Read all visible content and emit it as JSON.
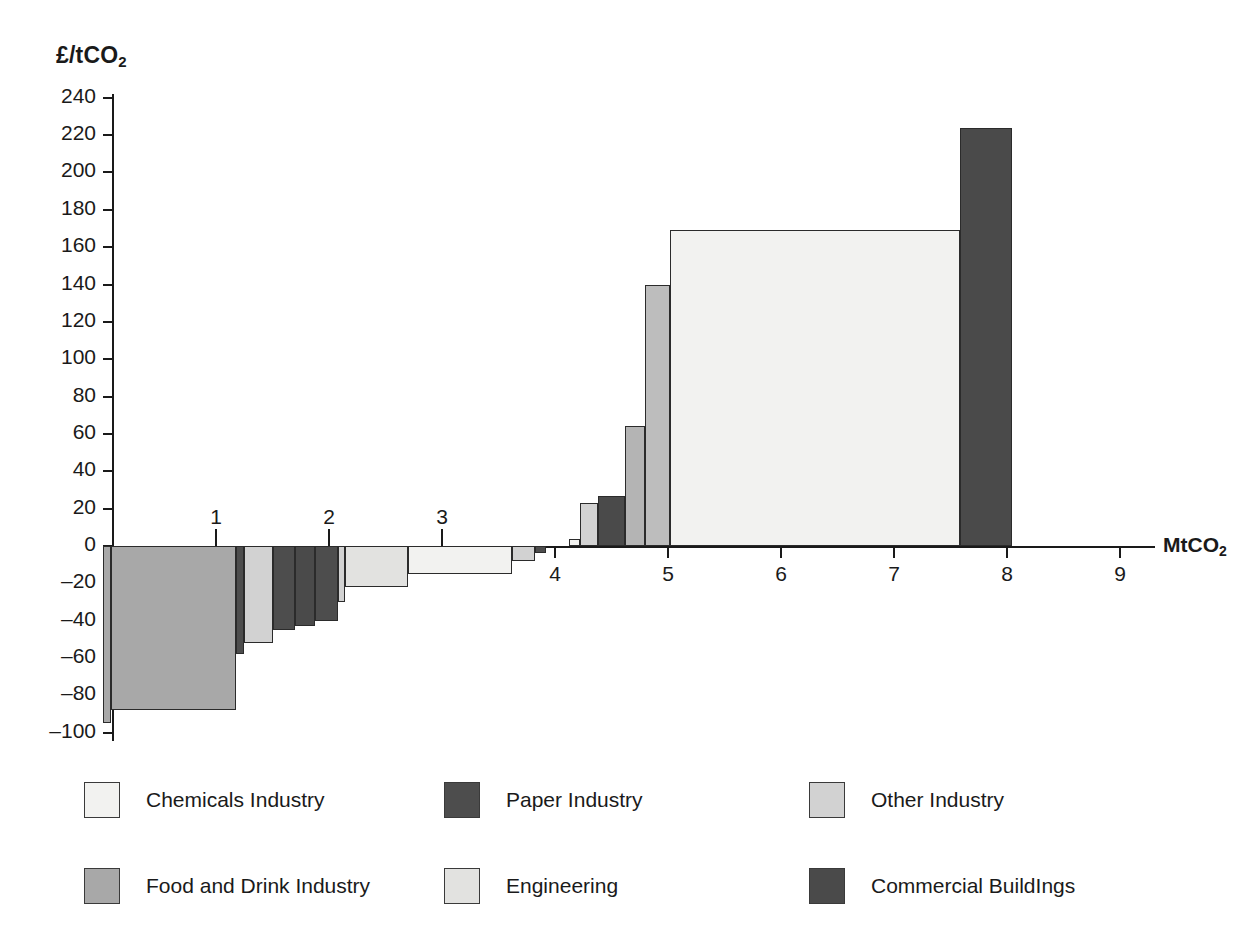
{
  "chart_data": {
    "type": "bar",
    "title": "",
    "subtitle": "",
    "xlabel": "MtCO2",
    "ylabel": "£/tCO2",
    "ylabel_rich": "£/tCO",
    "ylabel_sub": "2",
    "xlabel_rich": "MtCO",
    "xlabel_sub": "2",
    "xlim": [
      0,
      9
    ],
    "ylim": [
      -100,
      240
    ],
    "grid": false,
    "legend_position": "bottom",
    "orientation": "marginal-abatement-cost-curve",
    "y_ticks": [
      240,
      220,
      200,
      180,
      160,
      140,
      120,
      100,
      80,
      60,
      40,
      20,
      0,
      "-20",
      "-40",
      "-60",
      "-80",
      "-100"
    ],
    "x_ticks": [
      0,
      1,
      2,
      3,
      4,
      5,
      6,
      7,
      8,
      9
    ],
    "x_ticks_above_axis": [
      1,
      2,
      3
    ],
    "x_ticks_below_axis": [
      4,
      5,
      6,
      7,
      8,
      9
    ],
    "note": "Stacked-width marginal abatement cost curve. Each bar spans an x-range (MtCO2 potential) at a given cost (£/tCO2).",
    "series": [
      {
        "name": "Chemicals Industry",
        "color": "#f2f2f0"
      },
      {
        "name": "Paper Industry",
        "color": "#4d4d4d"
      },
      {
        "name": "Other Industry",
        "color": "#d2d2d2"
      },
      {
        "name": "Food and Drink Industry",
        "color": "#a8a8a8"
      },
      {
        "name": "Engineering",
        "color": "#e2e2e0"
      },
      {
        "name": "Commercial Buildings",
        "color": "#4a4a4a"
      }
    ],
    "bars": [
      {
        "sector": "Food and Drink Industry",
        "x_start": 0.0,
        "x_end": 0.07,
        "cost": -95,
        "color": "#a8a8a8"
      },
      {
        "sector": "Food and Drink Industry",
        "x_start": 0.07,
        "x_end": 1.18,
        "cost": -88,
        "color": "#a8a8a8"
      },
      {
        "sector": "Paper Industry",
        "x_start": 1.18,
        "x_end": 1.25,
        "cost": -58,
        "color": "#4d4d4d"
      },
      {
        "sector": "Other Industry",
        "x_start": 1.25,
        "x_end": 1.5,
        "cost": -52,
        "color": "#d2d2d2"
      },
      {
        "sector": "Paper Industry",
        "x_start": 1.5,
        "x_end": 1.7,
        "cost": -45,
        "color": "#4d4d4d"
      },
      {
        "sector": "Commercial Buildings",
        "x_start": 1.7,
        "x_end": 1.88,
        "cost": -43,
        "color": "#4a4a4a"
      },
      {
        "sector": "Paper Industry",
        "x_start": 1.88,
        "x_end": 2.08,
        "cost": -40,
        "color": "#4d4d4d"
      },
      {
        "sector": "Other Industry",
        "x_start": 2.08,
        "x_end": 2.14,
        "cost": -30,
        "color": "#d2d2d2"
      },
      {
        "sector": "Engineering",
        "x_start": 2.14,
        "x_end": 2.7,
        "cost": -22,
        "color": "#e2e2e0"
      },
      {
        "sector": "Chemicals Industry",
        "x_start": 2.7,
        "x_end": 3.62,
        "cost": -15,
        "color": "#f2f2f0"
      },
      {
        "sector": "Other Industry",
        "x_start": 3.62,
        "x_end": 3.82,
        "cost": -8,
        "color": "#d2d2d2"
      },
      {
        "sector": "Paper Industry",
        "x_start": 3.82,
        "x_end": 3.92,
        "cost": -4,
        "color": "#4d4d4d"
      },
      {
        "sector": "Chemicals Industry",
        "x_start": 4.12,
        "x_end": 4.22,
        "cost": 4,
        "color": "#f2f2f0"
      },
      {
        "sector": "Other Industry",
        "x_start": 4.22,
        "x_end": 4.38,
        "cost": 23,
        "color": "#d2d2d2"
      },
      {
        "sector": "Commercial Buildings",
        "x_start": 4.38,
        "x_end": 4.62,
        "cost": 27,
        "color": "#4a4a4a"
      },
      {
        "sector": "Other Industry",
        "x_start": 4.62,
        "x_end": 4.8,
        "cost": 64,
        "color": "#b4b4b4"
      },
      {
        "sector": "Other Industry",
        "x_start": 4.8,
        "x_end": 5.02,
        "cost": 140,
        "color": "#bdbdbd"
      },
      {
        "sector": "Chemicals Industry",
        "x_start": 5.02,
        "x_end": 7.58,
        "cost": 169,
        "color": "#f2f2f0"
      },
      {
        "sector": "Commercial Buildings",
        "x_start": 7.58,
        "x_end": 8.04,
        "cost": 224,
        "color": "#4a4a4a"
      }
    ]
  },
  "axes": {
    "y_title_main": "£/tCO",
    "y_title_sub": "2",
    "x_title_main": "MtCO",
    "x_title_sub": "2"
  },
  "legend": {
    "items": [
      {
        "label": "Chemicals Industry",
        "color": "#f2f2f0",
        "row": 0,
        "col": 0
      },
      {
        "label": "Paper Industry",
        "color": "#4d4d4d",
        "row": 0,
        "col": 1
      },
      {
        "label": "Other Industry",
        "color": "#d2d2d2",
        "row": 0,
        "col": 2
      },
      {
        "label": "Food and Drink Industry",
        "color": "#a8a8a8",
        "row": 1,
        "col": 0
      },
      {
        "label": "Engineering",
        "color": "#e2e2e0",
        "row": 1,
        "col": 1
      },
      {
        "label": "Commercial BuildIngs",
        "color": "#4a4a4a",
        "row": 1,
        "col": 2
      }
    ]
  }
}
